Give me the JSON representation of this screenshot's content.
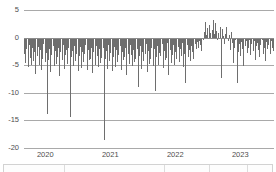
{
  "chart_data": {
    "type": "bar",
    "title": "",
    "subtitle": "",
    "xlabel": "",
    "ylabel": "",
    "ylim": [
      -20,
      5
    ],
    "yticks": [
      5,
      0,
      -5,
      -10,
      -15,
      -20
    ],
    "ytick_labels": [
      "5",
      "0",
      "-5",
      "-10",
      "-15",
      "-20"
    ],
    "xtick_labels": [
      "2020",
      "2021",
      "2022",
      "2023"
    ],
    "xtick_positions": [
      0.085,
      0.345,
      0.605,
      0.865
    ],
    "grid": true,
    "legend": "none",
    "bar_color": "#6e6e6e",
    "series": [
      {
        "name": "value",
        "values": [
          -3.0,
          -4.6,
          -2.1,
          -5.4,
          -1.4,
          -3.7,
          -5.0,
          -1.9,
          -4.2,
          -2.6,
          -6.6,
          -3.3,
          -1.7,
          -4.9,
          -2.3,
          -5.8,
          -3.9,
          -1.2,
          -4.4,
          -2.8,
          -13.8,
          -4.1,
          -2.0,
          -6.2,
          -3.1,
          -1.6,
          -5.2,
          -2.4,
          -4.7,
          -3.5,
          -1.9,
          -6.9,
          -2.7,
          -4.0,
          -1.3,
          -5.6,
          -3.2,
          -2.2,
          -4.8,
          -1.8,
          -14.3,
          -3.6,
          -2.5,
          -5.1,
          -1.5,
          -4.3,
          -2.9,
          -6.1,
          -3.4,
          -1.7,
          -5.5,
          -2.6,
          -4.5,
          -3.0,
          -1.4,
          -5.9,
          -2.3,
          -4.1,
          -3.8,
          -1.9,
          -6.4,
          -2.7,
          -4.9,
          -1.6,
          -3.3,
          -5.3,
          -2.1,
          -4.6,
          -3.7,
          -1.8,
          -18.6,
          -3.9,
          -2.4,
          -5.7,
          -1.3,
          -4.2,
          -2.8,
          -6.0,
          -3.5,
          -1.7,
          -5.4,
          -2.2,
          -4.4,
          -3.1,
          -1.5,
          -5.8,
          -2.6,
          -4.0,
          -3.6,
          -1.9,
          -6.7,
          -2.9,
          -4.8,
          -1.4,
          -3.2,
          -5.1,
          -2.3,
          -4.5,
          -3.9,
          -2.0,
          -8.9,
          -3.4,
          -1.6,
          -5.6,
          -2.7,
          -4.3,
          -3.0,
          -1.2,
          -6.3,
          -2.5,
          -4.7,
          -3.8,
          -1.8,
          -5.2,
          -2.1,
          -9.6,
          -3.5,
          -1.5,
          -4.9,
          -2.8,
          -3.3,
          -1.1,
          -5.5,
          -2.4,
          -4.1,
          -3.7,
          -0.9,
          -6.8,
          -2.2,
          -4.6,
          -3.1,
          -1.3,
          -5.0,
          -2.6,
          -3.9,
          -1.7,
          -4.4,
          -2.0,
          -3.4,
          -1.0,
          -5.3,
          -2.9,
          -8.2,
          -1.4,
          -3.6,
          -2.3,
          -4.2,
          -1.6,
          -2.7,
          -3.8,
          -1.2,
          -2.1,
          -0.8,
          -1.9,
          -0.6,
          -1.3,
          -2.4,
          -0.4,
          1.1,
          2.9,
          0.5,
          1.8,
          -0.3,
          2.2,
          0.9,
          1.4,
          3.1,
          0.7,
          2.6,
          1.2,
          -0.5,
          0.8,
          2.0,
          -7.4,
          1.5,
          0.3,
          -1.1,
          0.6,
          1.9,
          -0.7,
          0.4,
          -2.3,
          1.0,
          -0.9,
          -4.6,
          -1.8,
          -0.5,
          -8.3,
          -2.6,
          -1.2,
          -3.4,
          -0.8,
          -2.0,
          -5.1,
          -1.5,
          -0.6,
          -2.8,
          -1.9,
          -0.4,
          -3.2,
          -1.1,
          -2.5,
          -0.7,
          -4.0,
          -1.6,
          -0.9,
          -2.2,
          -3.5,
          -1.3,
          -0.5,
          -2.9,
          -1.8,
          -4.3,
          -0.8,
          -2.1,
          -1.4,
          -3.0,
          -0.6,
          -1.9,
          -2.4
        ]
      }
    ]
  },
  "axes": {
    "y_axis_name": "y-axis",
    "x_axis_name": "x-axis",
    "zero_line_name": "zero-baseline"
  },
  "bottom_panel": {
    "visible": true,
    "label": ""
  }
}
